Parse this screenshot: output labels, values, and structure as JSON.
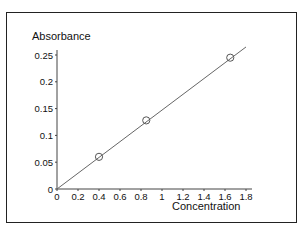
{
  "chart_data": {
    "type": "scatter",
    "title": "",
    "xlabel": "Concentration",
    "ylabel": "Absorbance",
    "xlim": [
      0,
      1.8
    ],
    "ylim": [
      0,
      0.25
    ],
    "x_ticks": [
      "0",
      "0.2",
      "0.4",
      "0.6",
      "0.8",
      "1",
      "1.2",
      "1.4",
      "1.6",
      "1.8"
    ],
    "y_ticks": [
      "0",
      "0.05",
      "0.1",
      "0.15",
      "0.2",
      "0.25"
    ],
    "grid": false,
    "legend": null,
    "series": [
      {
        "name": "measurements",
        "marker": "open-circle",
        "x": [
          0.4,
          0.85,
          1.65
        ],
        "y": [
          0.06,
          0.128,
          0.245
        ]
      },
      {
        "name": "fit-line",
        "style": "line",
        "x": [
          0,
          1.8
        ],
        "y": [
          0,
          0.265
        ]
      }
    ]
  },
  "labels": {
    "ylabel": "Absorbance",
    "xlabel": "Concentration",
    "caption": "Fi___ Pl_t of ___ __ __"
  }
}
